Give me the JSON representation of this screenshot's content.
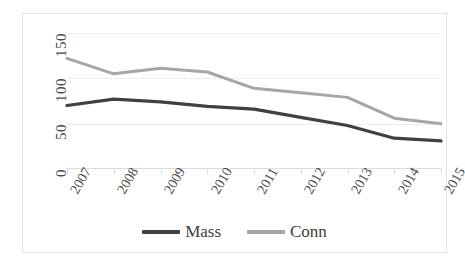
{
  "chart_data": {
    "type": "line",
    "title": "",
    "subtitle": "",
    "xlabel": "",
    "ylabel": "",
    "categories": [
      "2007",
      "2008",
      "2009",
      "2010",
      "2011",
      "2012",
      "2013",
      "2014",
      "2015"
    ],
    "series": [
      {
        "name": "Mass",
        "color": "#404040",
        "values": [
          70,
          77,
          74,
          69,
          66,
          57,
          48,
          34,
          31
        ]
      },
      {
        "name": "Conn",
        "color": "#a6a6a6",
        "values": [
          122,
          105,
          111,
          107,
          89,
          84,
          79,
          56,
          50
        ]
      }
    ],
    "ylim": [
      0,
      150
    ],
    "yticks": [
      0,
      50,
      100,
      150
    ],
    "ytick_labels": [
      "0",
      "50",
      "100",
      "150"
    ],
    "grid": true,
    "grid_axis": "y",
    "legend_position": "bottom",
    "annotations": []
  },
  "axes": {
    "y_tick_labels": [
      "150",
      "100",
      "50",
      "0"
    ],
    "x_tick_labels": [
      "2007",
      "2008",
      "2009",
      "2010",
      "2011",
      "2012",
      "2013",
      "2014",
      "2015"
    ]
  },
  "legend": {
    "entries": [
      {
        "label": "Mass",
        "color": "#404040"
      },
      {
        "label": "Conn",
        "color": "#a6a6a6"
      }
    ]
  },
  "colors": {
    "mass_line": "#404040",
    "conn_line": "#a6a6a6",
    "gridline": "#ededed",
    "frame": "#e3e3e3",
    "text": "#4a4a4a",
    "background": "#ffffff"
  }
}
